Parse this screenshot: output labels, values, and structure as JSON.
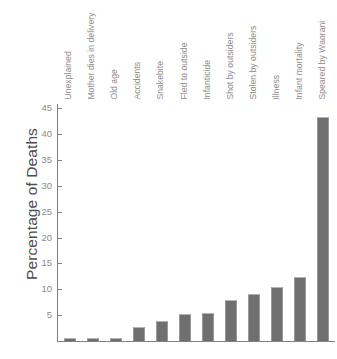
{
  "chart_data": {
    "type": "bar",
    "title": "",
    "xlabel": "",
    "ylabel": "Percentage of Deaths",
    "ylim": [
      0,
      47
    ],
    "yticks": [
      5,
      10,
      15,
      20,
      25,
      30,
      35,
      40,
      45
    ],
    "grid": false,
    "legend": null,
    "bar_color": "#6f6f6f",
    "axis_color": "#808080",
    "text_color": "#8d8d8d",
    "categories": [
      "Unexplained",
      "Mother dies in delivery",
      "Old age",
      "Accidents",
      "Snakebite",
      "Fled to outside",
      "Infanticide",
      "Shot by outsiders",
      "Stolen by outsiders",
      "Illness",
      "Infant mortality",
      "Speared by Waorani"
    ],
    "values": [
      0.5,
      0.5,
      0.5,
      2.7,
      3.9,
      5.2,
      5.5,
      7.9,
      9.0,
      10.5,
      12.3,
      43.2
    ]
  }
}
